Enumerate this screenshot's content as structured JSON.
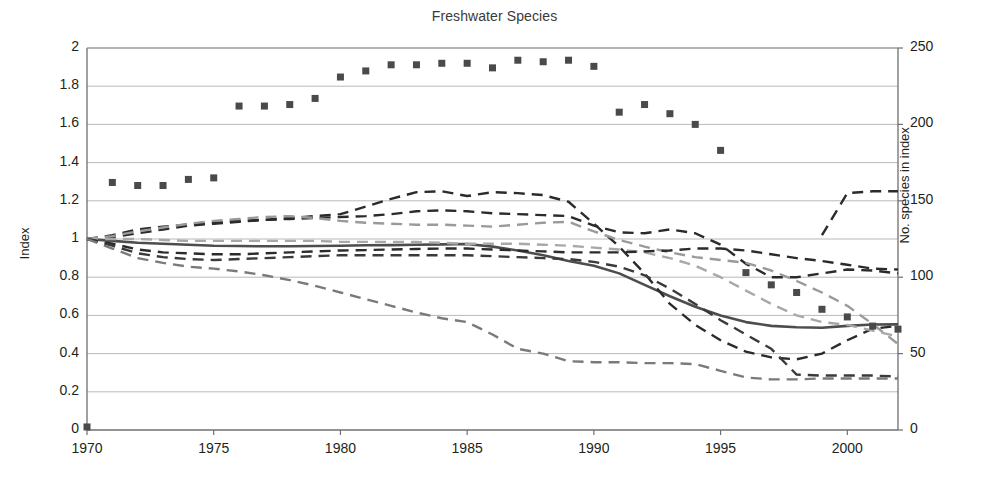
{
  "chart_data": {
    "type": "line",
    "title": "Freshwater Species",
    "xlabel": "",
    "ylabel": "Index",
    "ylabel_right": "No. species in index",
    "xlim": [
      1970,
      2002
    ],
    "ylim": [
      0,
      2
    ],
    "ylim_right": [
      0,
      250
    ],
    "grid": true,
    "legend": "none",
    "xticks": [
      1970,
      1975,
      1980,
      1985,
      1990,
      1995,
      2000
    ],
    "yticks_left": [
      0,
      0.2,
      0.4,
      0.6,
      0.8,
      1,
      1.2,
      1.4,
      1.6,
      1.8,
      2
    ],
    "yticks_right": [
      0,
      50,
      100,
      150,
      200,
      250
    ],
    "x": [
      1970,
      1971,
      1972,
      1973,
      1974,
      1975,
      1976,
      1977,
      1978,
      1979,
      1980,
      1981,
      1982,
      1983,
      1984,
      1985,
      1986,
      1987,
      1988,
      1989,
      1990,
      1991,
      1992,
      1993,
      1994,
      1995,
      1996,
      1997,
      1998,
      1999,
      2000,
      2001,
      2002
    ],
    "series": [
      {
        "name": "freshwater-index",
        "style": "solid",
        "color": "#4d4d4d",
        "width": 2.6,
        "values": [
          1.0,
          0.99,
          0.98,
          0.975,
          0.97,
          0.965,
          0.963,
          0.962,
          0.962,
          0.963,
          0.965,
          0.967,
          0.968,
          0.97,
          0.972,
          0.974,
          0.96,
          0.94,
          0.915,
          0.885,
          0.86,
          0.82,
          0.76,
          0.7,
          0.645,
          0.6,
          0.565,
          0.545,
          0.538,
          0.535,
          0.545,
          0.552,
          0.553
        ]
      },
      {
        "name": "upper-band-dark",
        "style": "dashed",
        "color": "#2b2b2b",
        "width": 2.4,
        "values": [
          1.0,
          1.02,
          1.05,
          1.065,
          1.075,
          1.085,
          1.095,
          1.1,
          1.105,
          1.11,
          1.115,
          1.12,
          1.13,
          1.145,
          1.15,
          1.145,
          1.135,
          1.13,
          1.125,
          1.12,
          1.07,
          1.035,
          1.03,
          1.05,
          1.03,
          0.97,
          0.87,
          0.8,
          0.8,
          0.82,
          0.84,
          0.835,
          0.82
        ]
      },
      {
        "name": "upper-band-peak-dark",
        "style": "dashed",
        "color": "#2b2b2b",
        "width": 2.4,
        "values": [
          1.0,
          1.01,
          1.03,
          1.05,
          1.07,
          1.08,
          1.09,
          1.1,
          1.11,
          1.12,
          1.13,
          1.17,
          1.21,
          1.245,
          1.25,
          1.225,
          1.245,
          1.24,
          1.23,
          1.195,
          1.08,
          0.96,
          0.82,
          0.66,
          0.55,
          0.47,
          0.41,
          0.38,
          0.37,
          0.4,
          0.47,
          0.53,
          0.545
        ]
      },
      {
        "name": "mid-band-light",
        "style": "dashed",
        "color": "#9a9a9a",
        "width": 2.4,
        "values": [
          1.0,
          1.015,
          1.04,
          1.06,
          1.08,
          1.095,
          1.105,
          1.115,
          1.12,
          1.11,
          1.095,
          1.085,
          1.08,
          1.075,
          1.075,
          1.07,
          1.065,
          1.075,
          1.085,
          1.09,
          1.04,
          0.995,
          0.96,
          0.93,
          0.905,
          0.89,
          0.875,
          0.835,
          0.78,
          0.72,
          0.65,
          0.555,
          0.45
        ]
      },
      {
        "name": "mid-band-light-2",
        "style": "dashed",
        "color": "#a8a8a8",
        "width": 2.4,
        "values": [
          1.0,
          1.0,
          1.0,
          0.995,
          0.99,
          0.99,
          0.99,
          0.99,
          0.99,
          0.99,
          0.985,
          0.985,
          0.985,
          0.985,
          0.98,
          0.975,
          0.975,
          0.975,
          0.97,
          0.965,
          0.955,
          0.945,
          0.93,
          0.9,
          0.86,
          0.8,
          0.73,
          0.66,
          0.6,
          0.565,
          0.55,
          0.52,
          0.49
        ]
      },
      {
        "name": "lower-band-dark",
        "style": "dashed",
        "color": "#2b2b2b",
        "width": 2.4,
        "values": [
          1.0,
          0.975,
          0.945,
          0.93,
          0.925,
          0.92,
          0.92,
          0.925,
          0.93,
          0.935,
          0.94,
          0.942,
          0.945,
          0.948,
          0.95,
          0.95,
          0.945,
          0.94,
          0.935,
          0.93,
          0.93,
          0.93,
          0.935,
          0.94,
          0.95,
          0.95,
          0.94,
          0.92,
          0.9,
          0.885,
          0.865,
          0.845,
          0.84
        ]
      },
      {
        "name": "lower-band-dark-2",
        "style": "dashed",
        "color": "#3a3a3a",
        "width": 2.4,
        "values": [
          1.0,
          0.965,
          0.925,
          0.905,
          0.895,
          0.89,
          0.895,
          0.9,
          0.905,
          0.91,
          0.915,
          0.915,
          0.915,
          0.915,
          0.915,
          0.915,
          0.91,
          0.905,
          0.9,
          0.895,
          0.88,
          0.855,
          0.81,
          0.74,
          0.66,
          0.575,
          0.5,
          0.425,
          0.29,
          0.285,
          0.285,
          0.285,
          0.28
        ]
      },
      {
        "name": "lowest-band-mid",
        "style": "dashed",
        "color": "#7a7a7a",
        "width": 2.4,
        "values": [
          1.0,
          0.95,
          0.9,
          0.875,
          0.855,
          0.845,
          0.83,
          0.81,
          0.785,
          0.755,
          0.72,
          0.685,
          0.65,
          0.615,
          0.585,
          0.565,
          0.5,
          0.425,
          0.4,
          0.36,
          0.355,
          0.355,
          0.35,
          0.35,
          0.345,
          0.31,
          0.275,
          0.265,
          0.265,
          0.27,
          0.27,
          0.27,
          0.27
        ]
      },
      {
        "name": "rising-tail-dark",
        "style": "dashed",
        "color": "#2b2b2b",
        "width": 2.4,
        "values": [
          null,
          null,
          null,
          null,
          null,
          null,
          null,
          null,
          null,
          null,
          null,
          null,
          null,
          null,
          null,
          null,
          null,
          null,
          null,
          null,
          null,
          null,
          null,
          null,
          null,
          null,
          null,
          null,
          null,
          1.02,
          1.24,
          1.25,
          1.25
        ]
      }
    ],
    "scatter": {
      "name": "no-species-in-index",
      "axis": "right",
      "marker": "square",
      "color": "#4a4a4a",
      "points": [
        {
          "x": 1970,
          "y": 2
        },
        {
          "x": 1971,
          "y": 162
        },
        {
          "x": 1972,
          "y": 160
        },
        {
          "x": 1973,
          "y": 160
        },
        {
          "x": 1974,
          "y": 164
        },
        {
          "x": 1975,
          "y": 165
        },
        {
          "x": 1976,
          "y": 212
        },
        {
          "x": 1977,
          "y": 212
        },
        {
          "x": 1978,
          "y": 213
        },
        {
          "x": 1979,
          "y": 217
        },
        {
          "x": 1980,
          "y": 231
        },
        {
          "x": 1981,
          "y": 235
        },
        {
          "x": 1982,
          "y": 239
        },
        {
          "x": 1983,
          "y": 239
        },
        {
          "x": 1984,
          "y": 240
        },
        {
          "x": 1985,
          "y": 240
        },
        {
          "x": 1986,
          "y": 237
        },
        {
          "x": 1987,
          "y": 242
        },
        {
          "x": 1988,
          "y": 241
        },
        {
          "x": 1989,
          "y": 242
        },
        {
          "x": 1990,
          "y": 238
        },
        {
          "x": 1991,
          "y": 208
        },
        {
          "x": 1992,
          "y": 213
        },
        {
          "x": 1993,
          "y": 207
        },
        {
          "x": 1994,
          "y": 200
        },
        {
          "x": 1995,
          "y": 183
        },
        {
          "x": 1996,
          "y": 103
        },
        {
          "x": 1997,
          "y": 95
        },
        {
          "x": 1998,
          "y": 90
        },
        {
          "x": 1999,
          "y": 79
        },
        {
          "x": 2000,
          "y": 74
        },
        {
          "x": 2001,
          "y": 68
        },
        {
          "x": 2002,
          "y": 66
        }
      ]
    }
  },
  "axes": {
    "plot": {
      "left": 87,
      "top": 48,
      "right": 898,
      "bottom": 430
    }
  }
}
